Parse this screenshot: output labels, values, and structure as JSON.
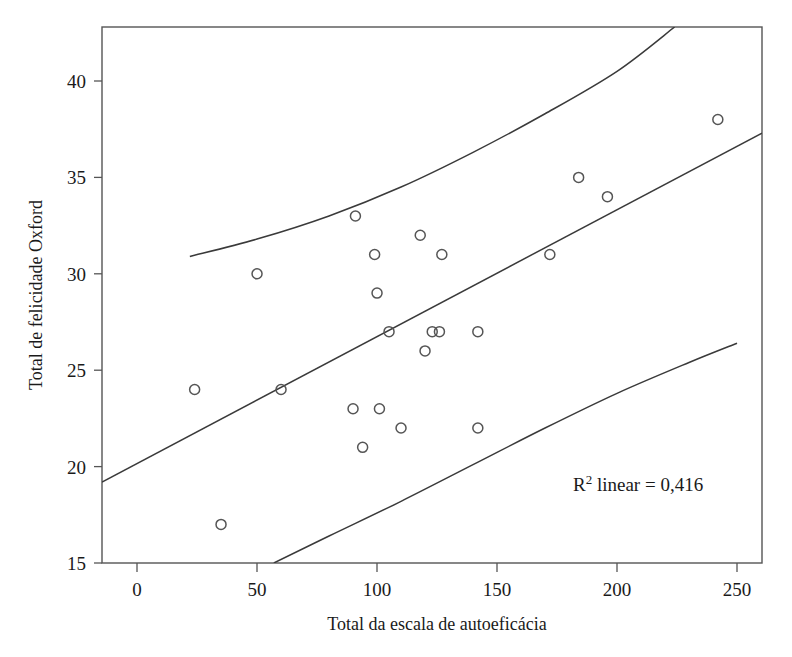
{
  "chart_data": {
    "type": "scatter",
    "title": "",
    "xlabel": "Total da escala de autoeficácia",
    "ylabel": "Total de felicidade Oxford",
    "xlim": [
      -14.6,
      260.4
    ],
    "ylim": [
      15,
      42.8
    ],
    "xticks": [
      0,
      50,
      100,
      150,
      200,
      250
    ],
    "xtick_labels": [
      "0",
      "50",
      "100",
      "150",
      "200",
      "250"
    ],
    "yticks": [
      15,
      20,
      25,
      30,
      35,
      40
    ],
    "ytick_labels": [
      "15",
      "20",
      "25",
      "30",
      "35",
      "40"
    ],
    "grid": false,
    "legend": "none",
    "marker_style": "open-circle",
    "annotations": [
      {
        "name": "r-squared-annotation",
        "text_prefix": "R",
        "text_superscript": "2",
        "text_suffix": " linear = 0,416",
        "full_text": "R2 linear = 0,416",
        "x": 196,
        "y": 19.0
      }
    ],
    "points": [
      {
        "x": 24,
        "y": 24
      },
      {
        "x": 35,
        "y": 17
      },
      {
        "x": 50,
        "y": 30
      },
      {
        "x": 60,
        "y": 24
      },
      {
        "x": 90,
        "y": 23
      },
      {
        "x": 91,
        "y": 33
      },
      {
        "x": 94,
        "y": 21
      },
      {
        "x": 99,
        "y": 31
      },
      {
        "x": 100,
        "y": 29
      },
      {
        "x": 101,
        "y": 23
      },
      {
        "x": 105,
        "y": 27
      },
      {
        "x": 110,
        "y": 22
      },
      {
        "x": 118,
        "y": 32
      },
      {
        "x": 120,
        "y": 26
      },
      {
        "x": 123,
        "y": 27
      },
      {
        "x": 126,
        "y": 27
      },
      {
        "x": 127,
        "y": 31
      },
      {
        "x": 142,
        "y": 27
      },
      {
        "x": 142,
        "y": 22
      },
      {
        "x": 172,
        "y": 31
      },
      {
        "x": 184,
        "y": 35
      },
      {
        "x": 196,
        "y": 34
      },
      {
        "x": 242,
        "y": 38
      }
    ],
    "fit_line": {
      "name": "linear-regression-line",
      "r_squared": 0.416,
      "x_start": -14.6,
      "y_start": 19.2,
      "x_end": 260.4,
      "y_end": 37.3
    },
    "confidence_bands": [
      {
        "name": "upper-confidence-band",
        "points": [
          {
            "x": 22,
            "y": 30.9
          },
          {
            "x": 50,
            "y": 31.8
          },
          {
            "x": 80,
            "y": 33.0
          },
          {
            "x": 110,
            "y": 34.5
          },
          {
            "x": 140,
            "y": 36.3
          },
          {
            "x": 170,
            "y": 38.3
          },
          {
            "x": 200,
            "y": 40.5
          },
          {
            "x": 224,
            "y": 42.8
          }
        ]
      },
      {
        "name": "lower-confidence-band",
        "points": [
          {
            "x": 57,
            "y": 15.0
          },
          {
            "x": 80,
            "y": 16.4
          },
          {
            "x": 110,
            "y": 18.2
          },
          {
            "x": 140,
            "y": 20.1
          },
          {
            "x": 170,
            "y": 22.0
          },
          {
            "x": 200,
            "y": 23.8
          },
          {
            "x": 230,
            "y": 25.4
          },
          {
            "x": 250,
            "y": 26.4
          }
        ]
      }
    ]
  },
  "colors": {
    "background": "#ffffff",
    "axis": "#555555",
    "marker": "#555555",
    "line": "#3a3a3a",
    "text": "#1a1a1a"
  }
}
